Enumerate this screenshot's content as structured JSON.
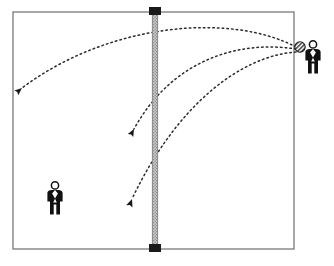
{
  "diagram": {
    "type": "court-trajectory-diagram",
    "canvas": {
      "width": 334,
      "height": 266
    },
    "colors": {
      "background": "#ffffff",
      "court_line": "#6e6e6e",
      "net_body": "#b6b6b6",
      "net_edge": "#8a8a8a",
      "net_cap": "#1a1a1a",
      "trajectory": "#2b2b2b",
      "figure": "#111111",
      "ball_fill": "#9a9a9a",
      "ball_stroke": "#1a1a1a"
    },
    "court": {
      "label": "court-boundary",
      "x": 13,
      "y": 12,
      "width": 281,
      "height": 237,
      "stroke_width": 1.2
    },
    "net": {
      "label": "net",
      "x": 152,
      "top_y": 12,
      "bottom_y": 249,
      "width": 6,
      "cap_width": 12,
      "cap_height": 8
    },
    "players": [
      {
        "name": "player-left-receiver",
        "side": "left",
        "x": 55,
        "y": 198,
        "scale": 1.0,
        "has_ball": false
      },
      {
        "name": "player-right-server",
        "side": "right",
        "x": 313,
        "y": 57,
        "scale": 1.0,
        "has_ball": true
      }
    ],
    "ball": {
      "name": "ball",
      "cx": 300,
      "cy": 47,
      "r": 5.2,
      "hatch": true
    },
    "trajectories": [
      {
        "name": "trajectory-deep-crosscourt",
        "id": 1,
        "description": "Long high arc from the ball over the net to the deep far-left corner",
        "start": {
          "x": 296,
          "y": 47
        },
        "control1": {
          "x": 232,
          "y": 13
        },
        "control2": {
          "x": 110,
          "y": 22
        },
        "end": {
          "x": 22,
          "y": 88
        },
        "arrowhead": {
          "x": 22,
          "y": 88,
          "angle_deg": 140
        },
        "dash": "1.6 3.1"
      },
      {
        "name": "trajectory-mid-court",
        "id": 2,
        "description": "Medium arc from the ball over the net landing mid court near the net",
        "start": {
          "x": 296,
          "y": 49
        },
        "control1": {
          "x": 238,
          "y": 40
        },
        "control2": {
          "x": 172,
          "y": 60
        },
        "end": {
          "x": 134,
          "y": 129
        },
        "arrowhead": {
          "x": 134,
          "y": 129,
          "angle_deg": 118
        },
        "dash": "1.6 3.1"
      },
      {
        "name": "trajectory-short-drop",
        "id": 3,
        "description": "Flattest arc from the ball over the net dropping short behind the net",
        "start": {
          "x": 296,
          "y": 52
        },
        "control1": {
          "x": 240,
          "y": 56
        },
        "control2": {
          "x": 176,
          "y": 106
        },
        "end": {
          "x": 132,
          "y": 199
        },
        "arrowhead": {
          "x": 132,
          "y": 199,
          "angle_deg": 110
        },
        "dash": "1.6 3.1"
      }
    ]
  }
}
